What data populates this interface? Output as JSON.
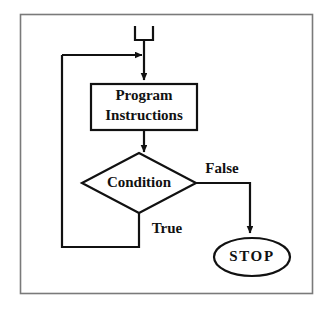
{
  "diagram": {
    "kind": "flowchart",
    "colors": {
      "stroke": "#111111",
      "fill": "#ffffff",
      "frame": "#7a7a7a",
      "background": "#ffffff"
    },
    "frame": {
      "x": 20,
      "y": 14,
      "width": 293,
      "height": 280
    },
    "nodes": [
      {
        "id": "start",
        "shape": "start-connector",
        "label": "",
        "x": 144,
        "y": 27,
        "width": 20,
        "height": 16
      },
      {
        "id": "process",
        "shape": "rectangle",
        "label_line1": "Program",
        "label_line2": "Instructions",
        "x": 91,
        "y": 84,
        "width": 106,
        "height": 46
      },
      {
        "id": "decision",
        "shape": "diamond",
        "label": "Condition",
        "cx": 139,
        "cy": 183,
        "rx": 57,
        "ry": 30
      },
      {
        "id": "stop",
        "shape": "ellipse",
        "label": "STOP",
        "cx": 252,
        "cy": 257,
        "rx": 38,
        "ry": 19
      }
    ],
    "edges": [
      {
        "id": "start-to-process",
        "from": "start",
        "to": "process",
        "label": ""
      },
      {
        "id": "process-to-decision",
        "from": "process",
        "to": "decision",
        "label": ""
      },
      {
        "id": "decision-false-to-stop",
        "from": "decision",
        "to": "stop",
        "label": "False"
      },
      {
        "id": "decision-true-loopback",
        "from": "decision",
        "to": "process",
        "label": "True"
      }
    ],
    "labels": {
      "process_line1": "Program",
      "process_line2": "Instructions",
      "decision": "Condition",
      "terminal": "STOP",
      "branch_false": "False",
      "branch_true": "True"
    }
  }
}
